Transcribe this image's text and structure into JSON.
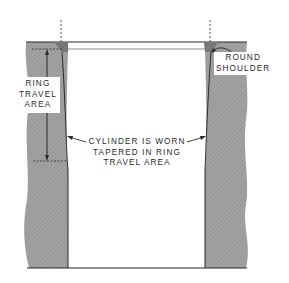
{
  "diagram": {
    "labels": {
      "ring_travel_area": [
        "RING",
        "TRAVEL",
        "AREA"
      ],
      "round_shoulder": [
        "ROUND",
        "SHOULDER"
      ],
      "cylinder_worn": [
        "CYLINDER IS WORN",
        "TAPERED IN RING",
        "TRAVEL AREA"
      ]
    },
    "colors": {
      "wall_fill": "#9a9a9a",
      "line": "#2a2a2a",
      "bore": "#ffffff"
    }
  }
}
